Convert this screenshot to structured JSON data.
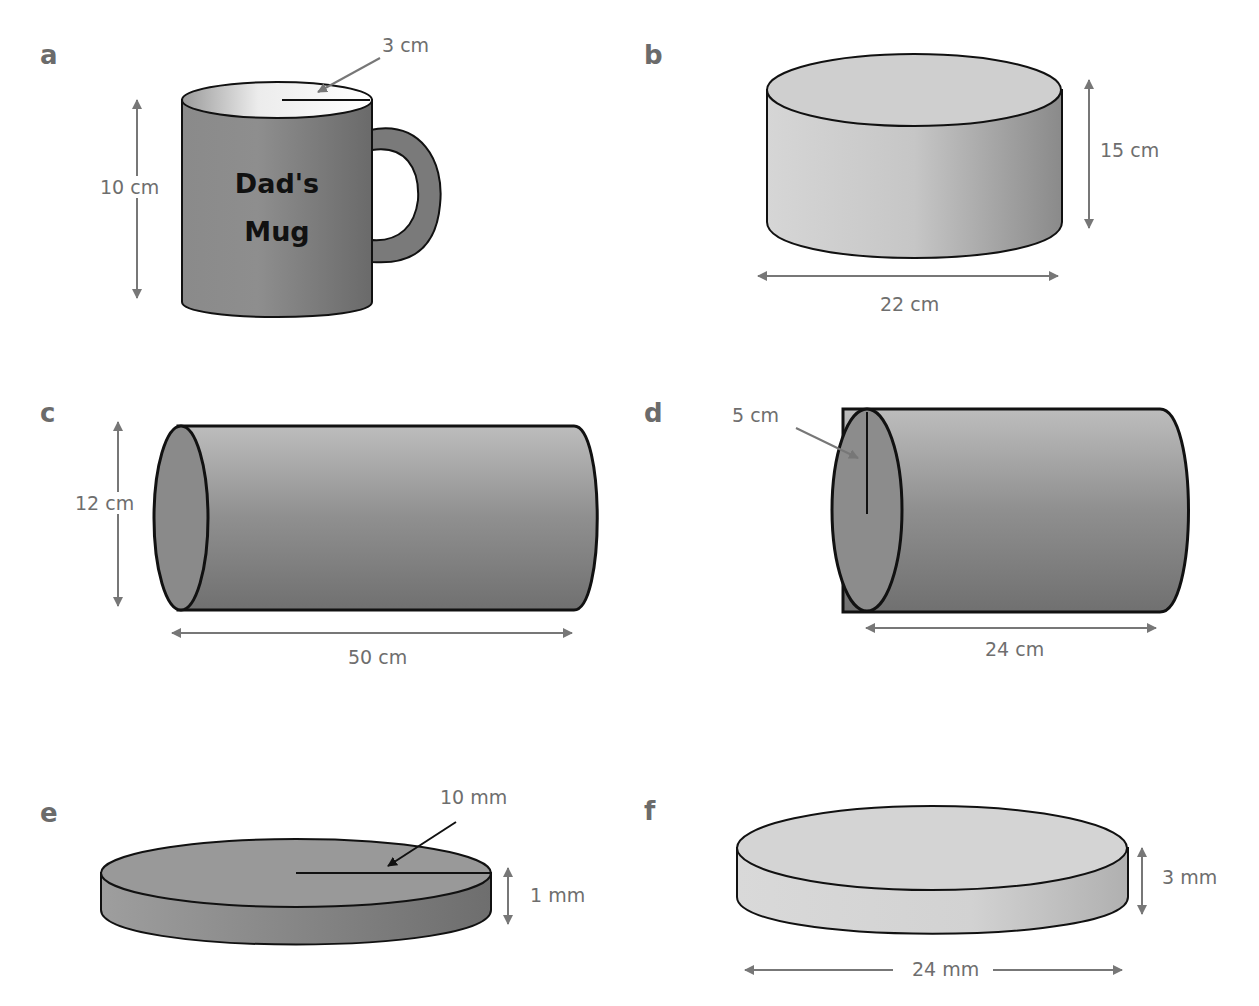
{
  "figures": [
    {
      "id": "a",
      "label": "a",
      "shape": "mug",
      "mug_text_line1": "Dad's",
      "mug_text_line2": "Mug",
      "dimensions": {
        "radius": "3 cm",
        "height": "10 cm"
      }
    },
    {
      "id": "b",
      "label": "b",
      "shape": "cylinder-upright",
      "dimensions": {
        "height": "15 cm",
        "diameter": "22 cm"
      }
    },
    {
      "id": "c",
      "label": "c",
      "shape": "cylinder-horizontal",
      "dimensions": {
        "diameter": "12 cm",
        "length": "50 cm"
      }
    },
    {
      "id": "d",
      "label": "d",
      "shape": "cylinder-horizontal",
      "dimensions": {
        "radius": "5 cm",
        "length": "24 cm"
      }
    },
    {
      "id": "e",
      "label": "e",
      "shape": "disc",
      "dimensions": {
        "radius": "10 mm",
        "height": "1 mm"
      }
    },
    {
      "id": "f",
      "label": "f",
      "shape": "disc",
      "dimensions": {
        "height": "3 mm",
        "diameter": "24 mm"
      }
    }
  ],
  "colors": {
    "outline": "#111111",
    "arrow": "#777777",
    "label": "#6b6b6b"
  }
}
